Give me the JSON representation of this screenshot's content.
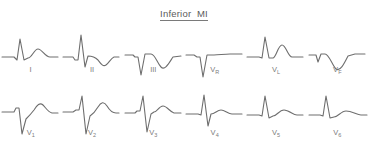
{
  "title": "Inferior  MI",
  "figure": {
    "type": "ecg-12-lead-diagram",
    "background_color": "#ffffff",
    "trace_color": "#6e6e6e",
    "label_color": "#7b7b7b",
    "rows": 2,
    "columns": 6
  },
  "leads": [
    {
      "id": "I",
      "label": "I",
      "label_base": "I",
      "label_sub": "",
      "row": 0,
      "col": 0,
      "morphology": "small q, tall narrow R wave, upright broad T wave",
      "path": "M2,30 L14,30 L17,33 L20,12 L24,33 L28,31 C32,31 34,22 38,22 C42,22 45,30 50,30 L58,30"
    },
    {
      "id": "II",
      "label": "II",
      "label_base": "II",
      "label_sub": "",
      "row": 0,
      "col": 1,
      "morphology": "tall R wave, deep S wave, inverted T wave",
      "path": "M2,30 L12,30 L14,33 L17,33 L20,8 L24,40 L27,29 C31,29 34,30 37,33 C40,37 42,40 45,38 C48,36 50,31 53,30 L58,30"
    },
    {
      "id": "III",
      "label": "III",
      "label_base": "III",
      "label_sub": "",
      "row": 0,
      "col": 2,
      "morphology": "deep pathological Q wave, inverted T wave",
      "path": "M2,28 L10,28 L12,30 L15,30 L18,48 L22,27 L28,27 C32,27 34,36 38,40 C42,44 46,36 50,30 L58,29"
    },
    {
      "id": "VR",
      "label": "VR",
      "label_base": "V",
      "label_sub": "R",
      "row": 0,
      "col": 3,
      "morphology": "deep QS complex, small upright T wave",
      "path": "M2,28 L10,28 L13,30 L16,30 L19,50 L23,28 L30,28 C35,28 40,27 46,27 L58,27"
    },
    {
      "id": "VL",
      "label": "VL",
      "label_base": "V",
      "label_sub": "L",
      "row": 0,
      "col": 4,
      "morphology": "tall R wave, upright peaked T wave",
      "path": "M2,30 L14,30 L17,31 L20,10 L24,31 L28,31 C31,31 33,18 37,18 C41,18 43,30 47,30 L58,30"
    },
    {
      "id": "VF",
      "label": "VF",
      "label_base": "V",
      "label_sub": "F",
      "row": 0,
      "col": 5,
      "morphology": "Q wave, small R, inverted T wave",
      "path": "M2,28 L9,28 L11,35 L14,27 L18,27 C22,27 25,38 29,42 C33,45 37,37 41,29 L48,27 L58,27"
    },
    {
      "id": "V1",
      "label": "V1",
      "label_base": "V",
      "label_sub": "1",
      "row": 1,
      "col": 0,
      "morphology": "small r wave, deep S wave, prominent upright T wave",
      "path": "M2,26 L14,26 L16,22 L19,22 L22,48 L26,33 C29,30 31,28 34,24 C37,19 40,16 43,19 C46,22 48,26 52,27 L58,27"
    },
    {
      "id": "V2",
      "label": "V2",
      "label_base": "V",
      "label_sub": "2",
      "row": 1,
      "col": 1,
      "morphology": "tall R wave, deep S wave, tall upright T wave",
      "path": "M2,26 L12,26 L15,24 L18,24 L21,10 L25,48 L29,30 C32,28 34,26 37,21 C40,16 43,15 46,20 C49,25 52,27 55,27 L58,27"
    },
    {
      "id": "V3",
      "label": "V3",
      "label_base": "V",
      "label_sub": "3",
      "row": 1,
      "col": 2,
      "morphology": "R wave, deep S wave, broad upright T wave",
      "path": "M2,27 L12,27 L14,25 L17,25 L20,10 L24,46 L28,28 L31,26 C34,26 36,20 40,20 C44,20 47,26 51,27 L58,27"
    },
    {
      "id": "V4",
      "label": "V4",
      "label_base": "V",
      "label_sub": "4",
      "row": 1,
      "col": 3,
      "morphology": "tall R wave, sharp S wave, modest T wave",
      "path": "M2,28 L14,28 L17,29 L20,9 L24,40 L27,28 C31,28 33,24 37,24 C41,24 44,28 48,28 L58,28"
    },
    {
      "id": "V5",
      "label": "V5",
      "label_base": "V",
      "label_sub": "5",
      "row": 1,
      "col": 4,
      "morphology": "tall narrow R wave, low broad T wave",
      "path": "M2,29 L14,29 L17,30 L20,10 L24,32 L28,30 C32,30 34,24 39,24 C44,24 48,29 52,29 L58,29"
    },
    {
      "id": "V6",
      "label": "V6",
      "label_base": "V",
      "label_sub": "6",
      "row": 1,
      "col": 5,
      "morphology": "tall narrow R wave, low broad T wave",
      "path": "M2,29 L13,29 L16,30 L19,10 L23,32 L27,31 C31,31 34,25 39,25 C45,25 50,29 54,29 L60,29"
    }
  ]
}
